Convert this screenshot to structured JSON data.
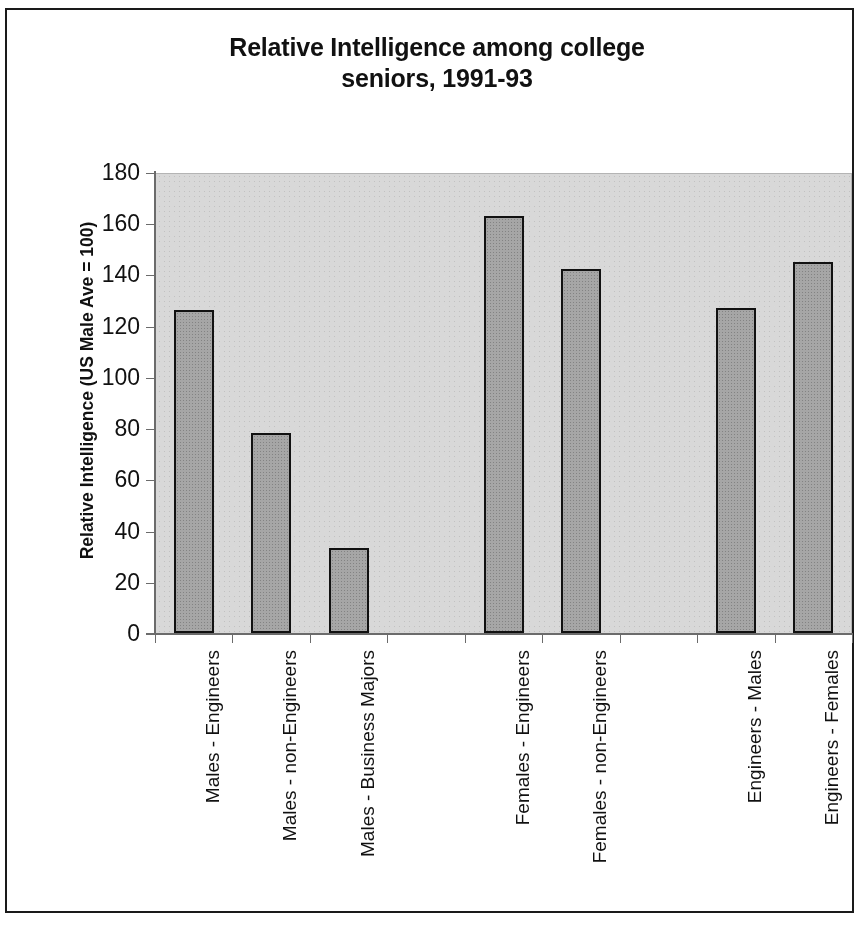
{
  "chart_data": {
    "type": "bar",
    "title": "Relative Intelligence among college seniors, 1991-93",
    "title_line1": "Relative Intelligence among college",
    "title_line2": "seniors, 1991-93",
    "xlabel": "",
    "ylabel": "Relative Intelligence (US Male Ave = 100)",
    "ylim": [
      0,
      180
    ],
    "ytick_step": 20,
    "ytick_labels": [
      "180",
      "160",
      "140",
      "120",
      "100",
      "80",
      "60",
      "40",
      "20",
      "0"
    ],
    "ytick_values": [
      180,
      160,
      140,
      120,
      100,
      80,
      60,
      40,
      20,
      0
    ],
    "grid": false,
    "legend": false,
    "slot_count": 9,
    "categories": [
      "Males - Engineers",
      "Males - non-Engineers",
      "Males - Business Majors",
      "",
      "Females - Engineers",
      "Females - non-Engineers",
      "",
      "Engineers - Males",
      "Engineers - Females"
    ],
    "values": [
      126,
      78,
      33,
      null,
      163,
      142,
      null,
      127,
      145
    ],
    "bars": [
      {
        "label": "Males - Engineers",
        "value": 126,
        "slot": 1
      },
      {
        "label": "Males - non-Engineers",
        "value": 78,
        "slot": 2
      },
      {
        "label": "Males - Business Majors",
        "value": 33,
        "slot": 3
      },
      {
        "label": "Females - Engineers",
        "value": 163,
        "slot": 5
      },
      {
        "label": "Females - non-Engineers",
        "value": 142,
        "slot": 6
      },
      {
        "label": "Engineers - Males",
        "value": 127,
        "slot": 8
      },
      {
        "label": "Engineers - Females",
        "value": 145,
        "slot": 9
      }
    ],
    "colors": {
      "bar_fill": "#a6a6a6",
      "bar_outline": "#111111",
      "plot_background": "#d8d8d8",
      "axis": "#6b6b6b",
      "text": "#111111",
      "page_background": "#ffffff",
      "frame_border": "#1a1a1a"
    }
  }
}
